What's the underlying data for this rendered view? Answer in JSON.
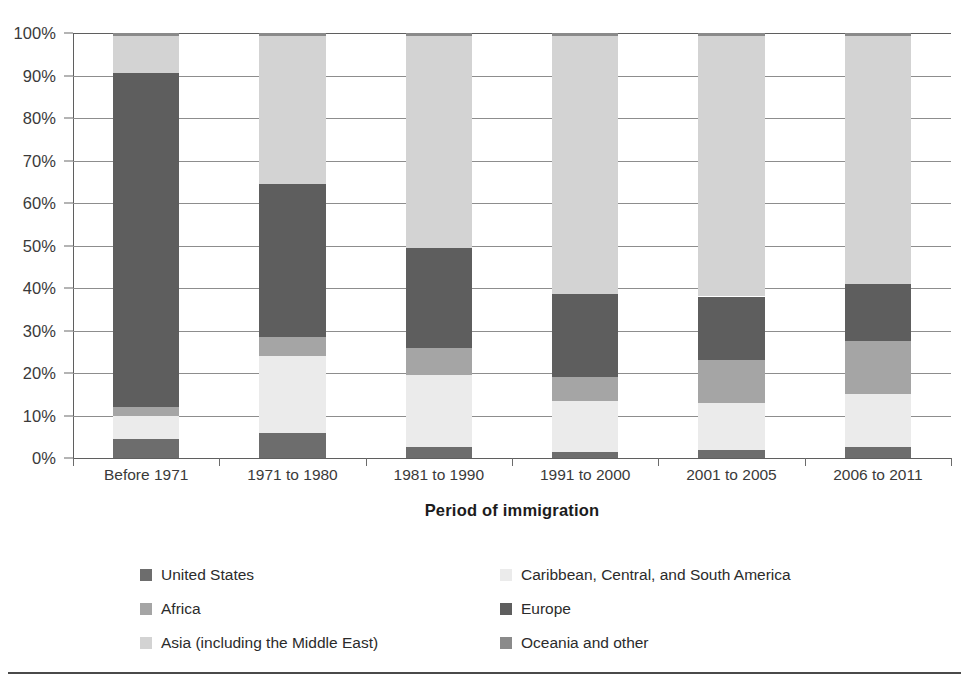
{
  "axis": {
    "y_ticks": [
      "0%",
      "10%",
      "20%",
      "30%",
      "40%",
      "50%",
      "60%",
      "70%",
      "80%",
      "90%",
      "100%"
    ],
    "x_title": "Period of immigration"
  },
  "legend": {
    "rows": [
      [
        {
          "label": "United States",
          "color": "#6d6d6d",
          "key": "united-states"
        },
        {
          "label": "Caribbean, Central, and South America",
          "color": "#ebebeb",
          "key": "caribbean-central-south-america"
        }
      ],
      [
        {
          "label": "Africa",
          "color": "#a5a5a5",
          "key": "africa"
        },
        {
          "label": "Europe",
          "color": "#5e5e5e",
          "key": "europe"
        }
      ],
      [
        {
          "label": "Asia (including the Middle East)",
          "color": "#d3d3d3",
          "key": "asia-including-middle-east"
        },
        {
          "label": "Oceania and other",
          "color": "#8a8a8a",
          "key": "oceania-and-other"
        }
      ]
    ]
  },
  "chart_data": {
    "type": "bar",
    "subtype": "stacked-100-percent",
    "title": "",
    "xlabel": "Period of immigration",
    "ylabel": "",
    "ylim": [
      0,
      100
    ],
    "ytick_values": [
      0,
      10,
      20,
      30,
      40,
      50,
      60,
      70,
      80,
      90,
      100
    ],
    "ytick_labels": [
      "0%",
      "10%",
      "20%",
      "30%",
      "40%",
      "50%",
      "60%",
      "70%",
      "80%",
      "90%",
      "100%"
    ],
    "grid": "horizontal",
    "legend_position": "bottom",
    "categories": [
      "Before 1971",
      "1971 to 1980",
      "1981 to 1990",
      "1991 to 2000",
      "2001 to 2005",
      "2006 to 2011"
    ],
    "series": [
      {
        "name": "United States",
        "color": "#6d6d6d",
        "values": [
          4.5,
          6.0,
          2.5,
          1.5,
          2.0,
          2.5
        ]
      },
      {
        "name": "Caribbean, Central, and South America",
        "color": "#ebebeb",
        "values": [
          5.5,
          18.0,
          17.0,
          12.0,
          11.0,
          12.5
        ]
      },
      {
        "name": "Africa",
        "color": "#a5a5a5",
        "values": [
          2.0,
          4.5,
          6.5,
          5.5,
          10.0,
          12.5
        ]
      },
      {
        "name": "Europe",
        "color": "#5e5e5e",
        "values": [
          78.5,
          36.0,
          23.5,
          19.5,
          15.0,
          13.5
        ]
      },
      {
        "name": "Asia (including the Middle East)",
        "color": "#d3d3d3",
        "values": [
          8.7,
          34.8,
          49.7,
          60.7,
          61.3,
          58.3
        ]
      },
      {
        "name": "Oceania and other",
        "color": "#8a8a8a",
        "values": [
          0.8,
          0.7,
          0.8,
          0.8,
          0.7,
          0.7
        ]
      }
    ]
  }
}
